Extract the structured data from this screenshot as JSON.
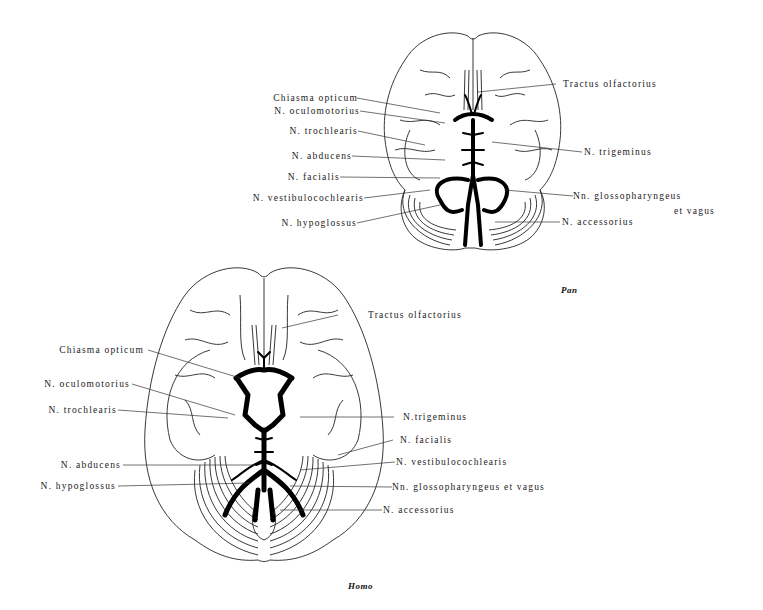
{
  "figure": {
    "pan": {
      "caption": "Pan",
      "labels_left": [
        {
          "id": "chiasma",
          "text": "Chiasma opticum"
        },
        {
          "id": "oculomotorius",
          "text": "N. oculomotorius"
        },
        {
          "id": "trochlearis",
          "text": "N. trochlearis"
        },
        {
          "id": "abducens",
          "text": "N. abducens"
        },
        {
          "id": "facialis",
          "text": "N. facialis"
        },
        {
          "id": "vestibulocochlearis",
          "text": "N. vestibulocochlearis"
        },
        {
          "id": "hypoglossus",
          "text": "N. hypoglossus"
        }
      ],
      "labels_right": [
        {
          "id": "olfactorius",
          "text": "Tractus olfactorius"
        },
        {
          "id": "trigeminus",
          "text": "N. trigeminus"
        },
        {
          "id": "glossopharyngeus",
          "text": "Nn. glossopharyngeus"
        },
        {
          "id": "glossopharyngeus_cont",
          "text": "et vagus"
        },
        {
          "id": "accessorius",
          "text": "N. accessorius"
        }
      ]
    },
    "homo": {
      "caption": "Homo",
      "labels_left": [
        {
          "id": "chiasma",
          "text": "Chiasma opticum"
        },
        {
          "id": "oculomotorius",
          "text": "N. oculomotorius"
        },
        {
          "id": "trochlearis",
          "text": "N. trochlearis"
        },
        {
          "id": "abducens",
          "text": "N. abducens"
        },
        {
          "id": "hypoglossus",
          "text": "N. hypoglossus"
        }
      ],
      "labels_right": [
        {
          "id": "olfactorius",
          "text": "Tractus olfactorius"
        },
        {
          "id": "trigeminus",
          "text": "N.trigeminus"
        },
        {
          "id": "facialis",
          "text": "N. facialis"
        },
        {
          "id": "vestibulocochlearis",
          "text": "N. vestibulocochlearis"
        },
        {
          "id": "glossopharyngeus",
          "text": "Nn. glossopharyngeus et vagus"
        },
        {
          "id": "accessorius",
          "text": "N. accessorius"
        }
      ]
    }
  }
}
